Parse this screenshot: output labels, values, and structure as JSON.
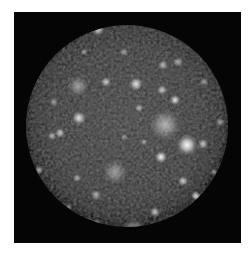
{
  "image": {
    "subject": "cratered moon disc",
    "background_color": "#050505",
    "border_color": "#ffffff",
    "disc": {
      "cx": 113,
      "cy": 114,
      "r": 101,
      "base_color": "#3c3c3c",
      "rim_color": "#1a1a1a"
    },
    "bright_spots": [
      {
        "x": 173,
        "y": 133,
        "r": 6,
        "o": 1.0
      },
      {
        "x": 151,
        "y": 113,
        "r": 9,
        "o": 0.55
      },
      {
        "x": 147,
        "y": 145,
        "r": 3.5,
        "o": 0.95
      },
      {
        "x": 189,
        "y": 132,
        "r": 3,
        "o": 0.7
      },
      {
        "x": 65,
        "y": 106,
        "r": 4,
        "o": 0.85
      },
      {
        "x": 84,
        "y": 17,
        "r": 4,
        "o": 0.8
      },
      {
        "x": 92,
        "y": 70,
        "r": 3,
        "o": 0.7
      },
      {
        "x": 64,
        "y": 74,
        "r": 6,
        "o": 0.45
      },
      {
        "x": 122,
        "y": 72,
        "r": 4,
        "o": 0.85
      },
      {
        "x": 148,
        "y": 78,
        "r": 3,
        "o": 0.7
      },
      {
        "x": 161,
        "y": 88,
        "r": 3,
        "o": 0.85
      },
      {
        "x": 149,
        "y": 53,
        "r": 3,
        "o": 0.6
      },
      {
        "x": 164,
        "y": 50,
        "r": 3,
        "o": 0.55
      },
      {
        "x": 125,
        "y": 96,
        "r": 2.5,
        "o": 0.6
      },
      {
        "x": 46,
        "y": 121,
        "r": 3,
        "o": 0.7
      },
      {
        "x": 38,
        "y": 124,
        "r": 2.5,
        "o": 0.6
      },
      {
        "x": 25,
        "y": 158,
        "r": 2.5,
        "o": 0.6
      },
      {
        "x": 101,
        "y": 160,
        "r": 7,
        "o": 0.45
      },
      {
        "x": 82,
        "y": 183,
        "r": 3,
        "o": 0.6
      },
      {
        "x": 82,
        "y": 212,
        "r": 3,
        "o": 0.6
      },
      {
        "x": 63,
        "y": 166,
        "r": 2.5,
        "o": 0.55
      },
      {
        "x": 169,
        "y": 169,
        "r": 3,
        "o": 0.75
      },
      {
        "x": 182,
        "y": 184,
        "r": 3,
        "o": 0.8
      },
      {
        "x": 141,
        "y": 200,
        "r": 3,
        "o": 0.7
      },
      {
        "x": 161,
        "y": 208,
        "r": 3,
        "o": 0.6
      },
      {
        "x": 120,
        "y": 218,
        "r": 7,
        "o": 0.5
      },
      {
        "x": 206,
        "y": 110,
        "r": 2.5,
        "o": 0.5
      },
      {
        "x": 40,
        "y": 90,
        "r": 2.5,
        "o": 0.5
      },
      {
        "x": 110,
        "y": 40,
        "r": 2.5,
        "o": 0.5
      },
      {
        "x": 70,
        "y": 40,
        "r": 2,
        "o": 0.5
      },
      {
        "x": 190,
        "y": 70,
        "r": 2.5,
        "o": 0.5
      },
      {
        "x": 200,
        "y": 160,
        "r": 2,
        "o": 0.5
      },
      {
        "x": 130,
        "y": 130,
        "r": 2,
        "o": 0.5
      },
      {
        "x": 110,
        "y": 125,
        "r": 2,
        "o": 0.4
      },
      {
        "x": 55,
        "y": 195,
        "r": 2,
        "o": 0.45
      }
    ]
  }
}
